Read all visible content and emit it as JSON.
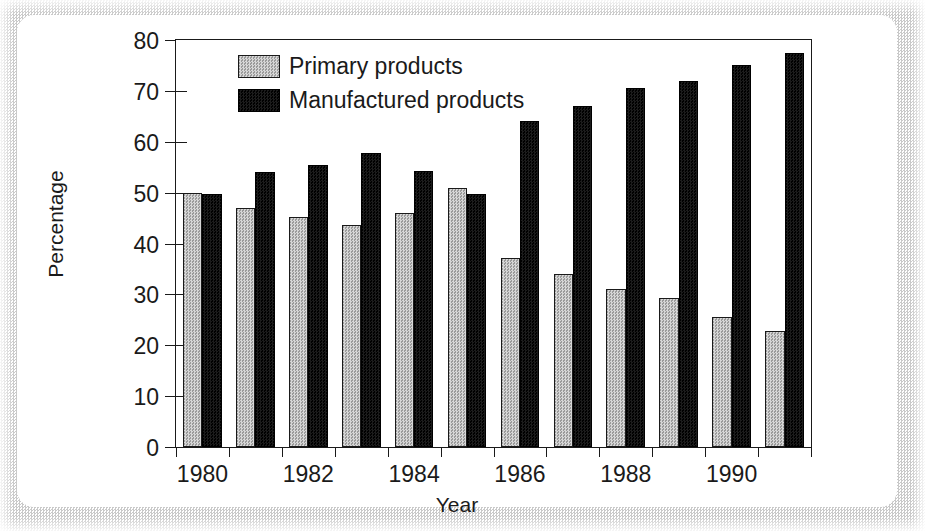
{
  "chart_data": {
    "type": "bar",
    "title": "",
    "xlabel": "Year",
    "ylabel": "Percentage",
    "ylim": [
      0,
      80
    ],
    "yticks": [
      0,
      10,
      20,
      30,
      40,
      50,
      60,
      70,
      80
    ],
    "grid": false,
    "legend_position": "top-left-inside",
    "categories": [
      "1980",
      "1981",
      "1982",
      "1983",
      "1984",
      "1985",
      "1986",
      "1987",
      "1988",
      "1989",
      "1990",
      "1991"
    ],
    "xtick_labels": [
      "1980",
      "1982",
      "1984",
      "1986",
      "1988",
      "1990"
    ],
    "xtick_categories": [
      "1980",
      "1982",
      "1984",
      "1986",
      "1988",
      "1990"
    ],
    "series": [
      {
        "name": "Primary products",
        "color": "#b3b3b3",
        "values": [
          50.0,
          47.0,
          45.3,
          43.7,
          46.0,
          51.0,
          37.2,
          34.0,
          31.0,
          29.3,
          25.5,
          22.8
        ]
      },
      {
        "name": "Manufactured products",
        "color": "#0c0c0c",
        "values": [
          49.8,
          54.0,
          55.5,
          57.7,
          54.3,
          49.8,
          64.0,
          67.0,
          70.5,
          72.0,
          75.0,
          77.4
        ]
      }
    ]
  },
  "figure": {
    "axis_color": "#1a1a1a",
    "background": "#ffffff",
    "frame_color": "#c9c9c9"
  }
}
